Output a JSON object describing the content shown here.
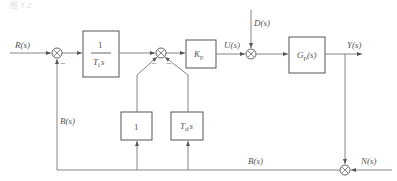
{
  "header": {
    "caption": "图 7-2"
  },
  "signals": {
    "input": "R(s)",
    "control": "U(s)",
    "disturbance": "D(s)",
    "output": "Y(s)",
    "noise": "N(s)",
    "feedback_left": "B(s)",
    "feedback_bottom": "B(s)"
  },
  "blocks": {
    "integral": {
      "num": "1",
      "den_main": "T",
      "den_sub": "i",
      "den_var": "s"
    },
    "gain": {
      "main": "K",
      "sub": "p"
    },
    "plant": {
      "main": "G",
      "sub": "p",
      "arg": "(s)"
    },
    "proportional_fb": {
      "text": "1"
    },
    "derivative_fb": {
      "main": "T",
      "sub": "d",
      "var": "s"
    }
  },
  "signs": {
    "sum1_feedback": "−",
    "sum2_left": "−",
    "sum2_right": "−"
  }
}
